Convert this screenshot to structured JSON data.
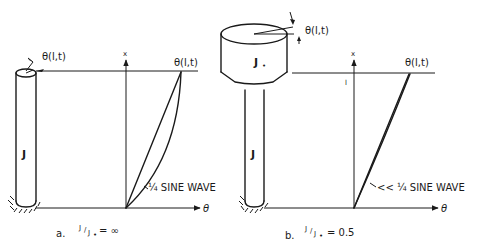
{
  "panels": [
    {
      "id": "a",
      "caption_prefix": "a.",
      "ratio_num": "J",
      "ratio_den": "J",
      "ratio_den_sub": "•",
      "ratio_value": "= ∞",
      "shaft_label": "J",
      "top_angle_label": "θ(l,t)",
      "axis_x_label": "x",
      "axis_theta_label": "θ",
      "curve_end_label": "θ(l,t)",
      "curve_annotation": "¼ SINE WAVE"
    },
    {
      "id": "b",
      "caption_prefix": "b.",
      "ratio_num": "J",
      "ratio_den": "J",
      "ratio_den_sub": "•",
      "ratio_value": "= 0.5",
      "shaft_label": "J",
      "disk_label": "J",
      "disk_label_sub": "•",
      "top_angle_label": "θ(l,t)",
      "axis_x_label": "x",
      "axis_l_label": "l",
      "axis_theta_label": "θ",
      "curve_end_label": "θ(l,t)",
      "curve_annotation": "<< ¼ SINE WAVE"
    }
  ]
}
